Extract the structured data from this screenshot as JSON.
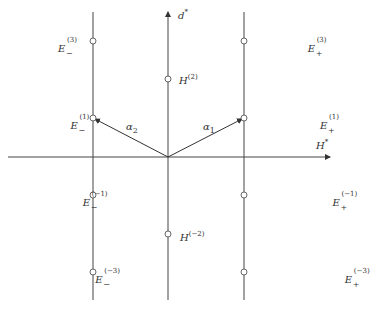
{
  "diagram": {
    "axes": {
      "horizontal": {
        "label": "H*",
        "base": "H",
        "sup": "*"
      },
      "vertical": {
        "label": "d*",
        "base": "d",
        "sup": "*"
      }
    },
    "vectors": [
      {
        "name": "α1",
        "base": "α",
        "sub": "1",
        "from": "origin",
        "to": "E+(1)"
      },
      {
        "name": "α2",
        "base": "α",
        "sub": "2",
        "from": "origin",
        "to": "E−(1)"
      }
    ],
    "left_column": [
      {
        "base": "E",
        "sup": "(3)",
        "sub": "−"
      },
      {
        "base": "E",
        "sup": "(1)",
        "sub": "−"
      },
      {
        "base": "E",
        "sup": "(−1)",
        "sub": "−"
      },
      {
        "base": "E",
        "sup": "(−3)",
        "sub": "−"
      }
    ],
    "center_column": [
      {
        "base": "H",
        "sup": "(2)"
      },
      {
        "base": "H",
        "sup": "(−2)"
      }
    ],
    "right_column": [
      {
        "base": "E",
        "sup": "(3)",
        "sub": "+"
      },
      {
        "base": "E",
        "sup": "(1)",
        "sub": "+"
      },
      {
        "base": "E",
        "sup": "(−1)",
        "sub": "+"
      },
      {
        "base": "E",
        "sup": "(−3)",
        "sub": "+"
      }
    ]
  }
}
